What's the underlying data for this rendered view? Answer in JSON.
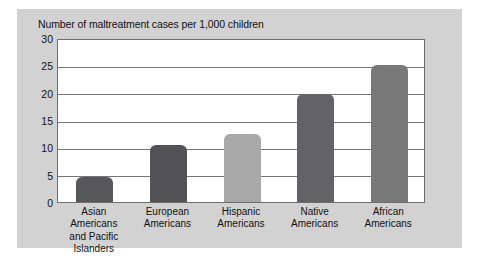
{
  "figure": {
    "background_color": "#ffffff",
    "panel_color": "#d2d2d2"
  },
  "chart_data": {
    "type": "bar",
    "title": "Number of maltreatment cases per 1,000 children",
    "xlabel": "",
    "ylabel": "",
    "ylim": [
      0,
      30
    ],
    "yticks": [
      0,
      5,
      10,
      15,
      20,
      25,
      30
    ],
    "ytick_labels": [
      "0",
      "5",
      "10",
      "15",
      "20",
      "25",
      "30"
    ],
    "grid": true,
    "grid_axis": "y",
    "legend": false,
    "categories": [
      "Asian Americans and Pacific Islanders",
      "European Americans",
      "Hispanic Americans",
      "Native Americans",
      "African Americans"
    ],
    "category_lines": [
      [
        "Asian Americans",
        "and Pacific",
        "Islanders"
      ],
      [
        "European",
        "Americans"
      ],
      [
        "Hispanic",
        "Americans"
      ],
      [
        "Native",
        "Americans"
      ],
      [
        "African",
        "Americans"
      ]
    ],
    "values": [
      4.5,
      10.5,
      12.5,
      19.8,
      25.0
    ],
    "bar_colors": [
      "#575759",
      "#535355",
      "#a8a8a8",
      "#636365",
      "#787878"
    ],
    "series": [
      {
        "name": "Number of maltreatment cases per 1,000 children",
        "values": [
          4.5,
          10.5,
          12.5,
          19.8,
          25.0
        ]
      }
    ]
  }
}
